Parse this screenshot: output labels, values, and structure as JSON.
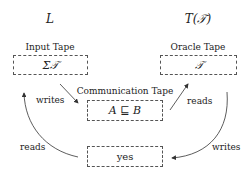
{
  "nodes": {
    "left_party": "L",
    "right_party": "T(𝒯)",
    "input_tape": {
      "label": "Input Tape",
      "content": "Σ𝒯"
    },
    "oracle_tape": {
      "label": "Oracle Tape",
      "content": "𝒯"
    },
    "communication_tape": {
      "label": "Communication Tape",
      "content": "A ⊑ B"
    },
    "output_tape": {
      "content": "yes"
    }
  },
  "edges": [
    {
      "from": "input_tape",
      "to": "communication_tape",
      "label": "writes"
    },
    {
      "from": "communication_tape",
      "to": "oracle_tape",
      "label": "reads"
    },
    {
      "from": "oracle_tape",
      "to": "output_tape",
      "label": "writes"
    },
    {
      "from": "output_tape",
      "to": "input_tape",
      "label": "reads"
    }
  ],
  "colors": {
    "stroke": "#555555",
    "text": "#222222"
  }
}
